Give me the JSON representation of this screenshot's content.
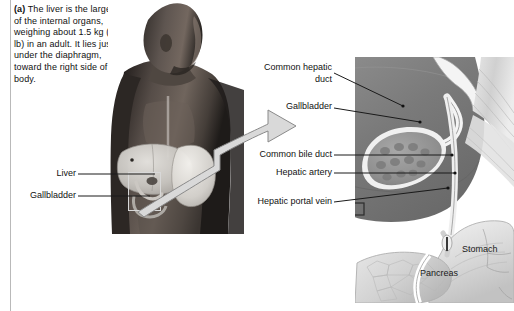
{
  "figure": {
    "caption_label": "(a)",
    "caption_text": " The liver is the largest of the internal organs, weighing about 1.5 kg (3.3 lb) in an adult. It lies just under the diaphragm, toward the right side of the body."
  },
  "photo_labels": [
    {
      "label": "Liver"
    },
    {
      "label": "Gallbladder"
    }
  ],
  "illustration_labels": [
    {
      "label_line1": "Common hepatic",
      "label_line2": "duct"
    },
    {
      "label_line1": "Gallbladder",
      "label_line2": ""
    },
    {
      "label_line1": "Common bile duct",
      "label_line2": ""
    },
    {
      "label_line1": "Hepatic artery",
      "label_line2": ""
    },
    {
      "label_line1": "Hepatic portal vein",
      "label_line2": ""
    }
  ],
  "overlay_labels": [
    {
      "label": "Stomach"
    },
    {
      "label": "Pancreas"
    }
  ],
  "colors": {
    "text": "#111111",
    "leader_line": "#1a1a1a",
    "margin_rule": "#b9b9b9",
    "arrow_fill": "#d9d9d9",
    "arrow_stroke": "#8a8a8a",
    "callout_box": "#d8d8d8",
    "illustration_dark": "#6e6e6e",
    "illustration_mid": "#9a9a9a",
    "illustration_light": "#d2d2d2"
  }
}
